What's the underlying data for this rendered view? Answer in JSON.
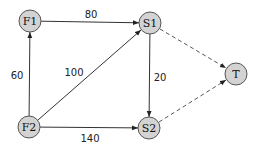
{
  "diagram": {
    "type": "directed-flow-network",
    "nodes": [
      {
        "id": "F1",
        "label": "F1",
        "x": 30,
        "y": 21
      },
      {
        "id": "S1",
        "label": "S1",
        "x": 150,
        "y": 23
      },
      {
        "id": "T",
        "label": "T",
        "x": 236,
        "y": 74
      },
      {
        "id": "F2",
        "label": "F2",
        "x": 29,
        "y": 127
      },
      {
        "id": "S2",
        "label": "S2",
        "x": 149,
        "y": 128
      }
    ],
    "edges": [
      {
        "from": "F1",
        "to": "S1",
        "label": "80",
        "style": "solid"
      },
      {
        "from": "F2",
        "to": "F1",
        "label": "60",
        "style": "solid"
      },
      {
        "from": "F2",
        "to": "S1",
        "label": "100",
        "style": "solid"
      },
      {
        "from": "F2",
        "to": "S2",
        "label": "140",
        "style": "solid"
      },
      {
        "from": "S1",
        "to": "S2",
        "label": "20",
        "style": "solid"
      },
      {
        "from": "S1",
        "to": "T",
        "label": "",
        "style": "dashed"
      },
      {
        "from": "S2",
        "to": "T",
        "label": "",
        "style": "dashed"
      }
    ],
    "edge_labels": {
      "f1_s1": "80",
      "f2_f1": "60",
      "f2_s1": "100",
      "s1_s2": "20",
      "f2_s2": "140"
    },
    "node_labels": {
      "f1": "F1",
      "s1": "S1",
      "t": "T",
      "f2": "F2",
      "s2": "S2"
    },
    "colors": {
      "node_fill": "#d3d3d3",
      "node_stroke": "#555555",
      "edge": "#333333"
    }
  }
}
